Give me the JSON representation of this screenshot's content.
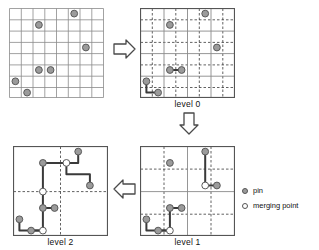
{
  "figure": {
    "title": "",
    "panels": [
      {
        "id": "input-grid",
        "caption": "",
        "grid": {
          "solid_divisions": 8,
          "dashed_divisions": 0,
          "size": 8
        },
        "pins": [
          [
            5,
            0
          ],
          [
            2,
            1
          ],
          [
            6,
            3
          ],
          [
            2,
            5
          ],
          [
            3,
            5
          ],
          [
            0,
            6
          ],
          [
            1,
            7
          ]
        ],
        "merging_points": [],
        "routes": []
      },
      {
        "id": "level0",
        "caption": "level 0",
        "grid": {
          "solid_divisions": 4,
          "dashed_divisions": 8,
          "size": 8
        },
        "pins": [
          [
            5,
            0
          ],
          [
            2,
            1
          ],
          [
            6,
            3
          ],
          [
            2,
            5
          ],
          [
            3,
            5
          ],
          [
            0,
            6
          ],
          [
            1,
            7
          ]
        ],
        "merging_points": [],
        "routes": [
          {
            "points": [
              [
                2,
                5
              ],
              [
                3,
                5
              ]
            ]
          },
          {
            "points": [
              [
                0,
                6
              ],
              [
                0,
                7
              ],
              [
                1,
                7
              ]
            ]
          }
        ]
      },
      {
        "id": "level1",
        "caption": "level 1",
        "grid": {
          "solid_divisions": 2,
          "dashed_divisions": 4,
          "size": 8
        },
        "pins": [
          [
            5,
            0
          ],
          [
            2,
            1
          ],
          [
            6,
            3
          ],
          [
            2,
            5
          ],
          [
            3,
            5
          ],
          [
            0,
            6
          ],
          [
            1,
            7
          ]
        ],
        "merging_points": [
          [
            5,
            3
          ],
          [
            2,
            7
          ]
        ],
        "routes": [
          {
            "points": [
              [
                5,
                0
              ],
              [
                5,
                3
              ],
              [
                6,
                3
              ]
            ]
          },
          {
            "points": [
              [
                2,
                5
              ],
              [
                3,
                5
              ]
            ]
          },
          {
            "points": [
              [
                2,
                5
              ],
              [
                2,
                7
              ],
              [
                0,
                7
              ],
              [
                0,
                6
              ]
            ]
          },
          {
            "points": [
              [
                1,
                7
              ],
              [
                2,
                7
              ]
            ]
          }
        ]
      },
      {
        "id": "level2",
        "caption": "level 2",
        "grid": {
          "solid_divisions": 1,
          "dashed_divisions": 2,
          "size": 8
        },
        "pins": [
          [
            5,
            0
          ],
          [
            2,
            1
          ],
          [
            6,
            3
          ],
          [
            2,
            5
          ],
          [
            3,
            5
          ],
          [
            0,
            6
          ],
          [
            1,
            7
          ]
        ],
        "merging_points": [
          [
            4,
            1
          ],
          [
            2,
            3
          ],
          [
            2,
            7
          ]
        ],
        "routes": [
          {
            "points": [
              [
                2,
                1
              ],
              [
                4,
                1
              ],
              [
                5,
                1
              ],
              [
                5,
                0
              ]
            ]
          },
          {
            "points": [
              [
                4,
                1
              ],
              [
                4,
                2
              ],
              [
                6,
                2
              ],
              [
                6,
                3
              ]
            ]
          },
          {
            "points": [
              [
                2,
                1
              ],
              [
                2,
                3
              ],
              [
                2,
                5
              ],
              [
                3,
                5
              ]
            ]
          },
          {
            "points": [
              [
                2,
                5
              ],
              [
                2,
                7
              ],
              [
                0,
                7
              ],
              [
                0,
                6
              ]
            ]
          },
          {
            "points": [
              [
                1,
                7
              ],
              [
                2,
                7
              ]
            ]
          }
        ]
      }
    ],
    "arrows": [
      {
        "id": "arrow-input-to-level0",
        "direction": "right"
      },
      {
        "id": "arrow-level0-to-level1",
        "direction": "down"
      },
      {
        "id": "arrow-level1-to-level2",
        "direction": "left"
      }
    ],
    "legend": {
      "items": [
        {
          "marker": "pin-marker",
          "label": "pin",
          "fill": "#9b9b9b"
        },
        {
          "marker": "merging-point-marker",
          "label": "merging point",
          "fill": "#ffffff"
        }
      ]
    },
    "colors": {
      "grid_solid": "#8a8a8a",
      "grid_dashed": "#3a3a3a",
      "border": "#555555",
      "pin_fill": "#9b9b9b",
      "pin_stroke": "#5a5a5a",
      "merge_fill": "#ffffff",
      "merge_stroke": "#5a5a5a",
      "route": "#3a3a3a",
      "arrow": "#4a4a4a"
    }
  }
}
